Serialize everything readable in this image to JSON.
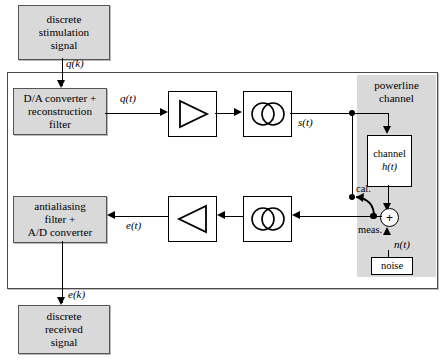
{
  "diagram": {
    "blocks": {
      "stimulation": "discrete\nstimulation\nsignal",
      "stimulation_lines": [
        "discrete",
        "stimulation",
        "signal"
      ],
      "da_converter_lines": [
        "D/A converter +",
        "reconstruction",
        "filter"
      ],
      "antialiasing_lines": [
        "antialiasing",
        "filter +",
        "A/D converter"
      ],
      "received_lines": [
        "discrete",
        "received",
        "signal"
      ],
      "channel_lines": [
        "channel",
        "h(t)"
      ],
      "channel_name": "channel",
      "channel_transfer": "h(t)",
      "noise": "noise"
    },
    "zone": {
      "powerline_label_lines": [
        "powerline",
        "channel"
      ],
      "powerline_line1": "powerline",
      "powerline_line2": "channel"
    },
    "signals": {
      "qk": "q(k)",
      "qt": "q(t)",
      "st": "s(t)",
      "et": "e(t)",
      "ek": "e(k)",
      "nt": "n(t)"
    },
    "switch": {
      "cal_label": "cal.",
      "meas_label": "meas."
    },
    "symbols": {
      "sum_operator": "+"
    },
    "colors": {
      "block_fill": "#d9d9d9",
      "zone_fill": "#d9d9d9",
      "line": "#000000",
      "border": "#4a4a4a",
      "page": "#ffffff"
    }
  }
}
